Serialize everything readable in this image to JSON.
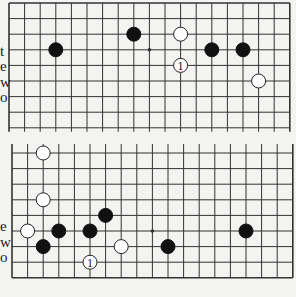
{
  "colors": {
    "background": "#f3f3f1",
    "line": "#333333",
    "black_stone": "#111111",
    "white_stone": "#ffffff"
  },
  "margin_text": {
    "top": [
      {
        "char": "t",
        "x": 0,
        "y": 44
      },
      {
        "char": "e",
        "x": 0,
        "y": 59
      },
      {
        "char": "w",
        "x": 0,
        "y": 75
      },
      {
        "char": "o",
        "x": 0,
        "y": 90
      }
    ],
    "bottom": [
      {
        "char": "e",
        "x": 0,
        "y": 219
      },
      {
        "char": "w",
        "x": 0,
        "y": 235
      },
      {
        "char": "o",
        "x": 0,
        "y": 250
      }
    ]
  },
  "boards": [
    {
      "name": "top-diagram",
      "origin_x": 9,
      "origin_y": 3,
      "spacing": 15.6,
      "cols": 19,
      "rows": 9,
      "top_edge": true,
      "bottom_edge": false,
      "left_edge": true,
      "right_edge": true,
      "line_extension": 4,
      "hoshi": [
        [
          9,
          3
        ]
      ],
      "stones": [
        {
          "color": "black",
          "col": 3,
          "row": 3
        },
        {
          "color": "black",
          "col": 8,
          "row": 2
        },
        {
          "color": "white",
          "col": 11,
          "row": 2
        },
        {
          "color": "white",
          "col": 11,
          "row": 4,
          "label": "1"
        },
        {
          "color": "black",
          "col": 13,
          "row": 3
        },
        {
          "color": "black",
          "col": 15,
          "row": 3
        },
        {
          "color": "white",
          "col": 16,
          "row": 5
        }
      ]
    },
    {
      "name": "bottom-diagram",
      "origin_x": 12,
      "origin_y": 153,
      "spacing": 15.6,
      "cols": 19,
      "rows": 9,
      "top_edge": false,
      "bottom_edge": true,
      "left_edge": true,
      "right_edge": true,
      "line_extension": 9,
      "hoshi": [
        [
          9,
          5
        ]
      ],
      "stones": [
        {
          "color": "white",
          "col": 2,
          "row": 0
        },
        {
          "color": "white",
          "col": 2,
          "row": 3
        },
        {
          "color": "black",
          "col": 6,
          "row": 4
        },
        {
          "color": "white",
          "col": 1,
          "row": 5
        },
        {
          "color": "black",
          "col": 3,
          "row": 5
        },
        {
          "color": "black",
          "col": 5,
          "row": 5
        },
        {
          "color": "black",
          "col": 2,
          "row": 6
        },
        {
          "color": "white",
          "col": 7,
          "row": 6
        },
        {
          "color": "white",
          "col": 5,
          "row": 7,
          "label": "1"
        },
        {
          "color": "black",
          "col": 10,
          "row": 6
        },
        {
          "color": "black",
          "col": 15,
          "row": 5
        }
      ]
    }
  ]
}
